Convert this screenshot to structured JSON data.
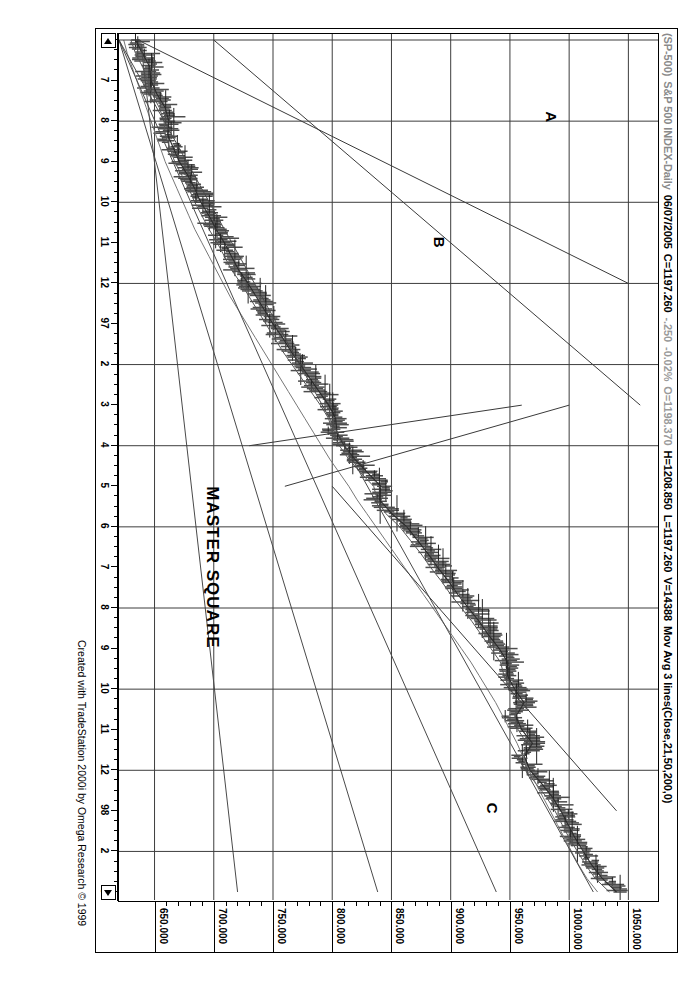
{
  "window": {
    "title_bar": {
      "symbol": "(SP-500)",
      "name": "S&P 500 INDEX-Daily",
      "date": "06/07/2005",
      "close": "C=1197.260",
      "change": "-.250",
      "change_pct": "-0.02%",
      "open": "O=1198.370",
      "high": "H=1208.850",
      "low": "L=1197.260",
      "volume": "V=14388",
      "indicator": "Mov Avg 3 lines(Close,21,50,200,0)"
    }
  },
  "credit": "Created with TradeStation 2000i by Omega Research © 1999",
  "annotations": [
    {
      "id": "a",
      "label": "A"
    },
    {
      "id": "b",
      "label": "B"
    },
    {
      "id": "c",
      "label": "C"
    },
    {
      "id": "master",
      "label": "MASTER SQUARE"
    }
  ],
  "scroll": {
    "left_arrow": "scroll-left",
    "right_arrow": "scroll-right"
  },
  "colors": {
    "bars": "#4d4d4d",
    "ma_short": "#2b2b2b",
    "ma_mid": "#555555",
    "ma_long": "#777777",
    "grid": "#3d3d3d",
    "axis": "#000000",
    "background": "#ffffff"
  },
  "chart_data": {
    "type": "line",
    "subtitle": "Mov Avg 3 lines(Close,21,50,200,0)",
    "xlabel": "",
    "ylabel": "",
    "grid": true,
    "legend": "none",
    "ylim": [
      620,
      1075
    ],
    "yticks": [
      1050.0,
      1000.0,
      950.0,
      900.0,
      850.0,
      800.0,
      750.0,
      700.0,
      650.0
    ],
    "ytick_labels": [
      "1050.000",
      "1000.000",
      "950.000",
      "900.000",
      "850.000",
      "800.000",
      "750.000",
      "700.000",
      "650.000"
    ],
    "xticks": [
      "6",
      "7",
      "8",
      "9",
      "10",
      "11",
      "12",
      "97",
      "2",
      "3",
      "4",
      "5",
      "6",
      "7",
      "8",
      "9",
      "10",
      "11",
      "12",
      "98",
      "2",
      "3"
    ],
    "xtick_labels": [
      "6",
      "7",
      "8",
      "9",
      "10",
      "11",
      "12",
      "97",
      "2",
      "3",
      "4",
      "5",
      "6",
      "7",
      "8",
      "9",
      "10",
      "11",
      "12",
      "98",
      "2",
      "3"
    ],
    "quote": {
      "date": "06/07/2005",
      "open": 1198.37,
      "high": 1208.85,
      "low": 1197.26,
      "close": 1197.26,
      "change": -0.25,
      "change_pct": -0.02,
      "volume": 14388
    },
    "series": [
      {
        "name": "Price (OHLC bars)",
        "type": "ohlc",
        "x": [
          "6",
          "6.3",
          "6.6",
          "7",
          "7.3",
          "7.6",
          "8",
          "8.3",
          "8.6",
          "9",
          "9.3",
          "9.6",
          "10",
          "10.3",
          "10.6",
          "11",
          "11.3",
          "11.6",
          "12",
          "12.3",
          "12.6",
          "97",
          "97.3",
          "97.6",
          "2",
          "2.3",
          "2.6",
          "3",
          "3.3",
          "3.6",
          "4",
          "4.3",
          "4.6",
          "5",
          "5.3",
          "5.6",
          "6",
          "6.3",
          "6.6",
          "7",
          "7.3",
          "7.6",
          "8",
          "8.3",
          "8.6",
          "9",
          "9.3",
          "9.6",
          "10",
          "10.3",
          "10.6",
          "11",
          "11.3",
          "11.6",
          "12",
          "12.3",
          "12.6",
          "98",
          "98.3",
          "98.6",
          "2",
          "2.3",
          "2.6",
          "3"
        ],
        "values": [
          636,
          641,
          648,
          645,
          650,
          660,
          663,
          658,
          667,
          672,
          679,
          685,
          690,
          697,
          703,
          710,
          716,
          722,
          730,
          737,
          744,
          751,
          759,
          766,
          774,
          782,
          790,
          798,
          806,
          800,
          812,
          820,
          832,
          845,
          838,
          852,
          866,
          874,
          883,
          891,
          900,
          908,
          917,
          926,
          934,
          943,
          951,
          946,
          957,
          965,
          950,
          962,
          972,
          958,
          969,
          979,
          988,
          995,
          1000,
          1006,
          1013,
          1020,
          1030,
          1043
        ]
      },
      {
        "name": "Mov Avg 21",
        "type": "line",
        "period": 21,
        "values": [
          634,
          640,
          646,
          647,
          652,
          659,
          662,
          661,
          666,
          671,
          678,
          684,
          689,
          696,
          702,
          709,
          715,
          721,
          729,
          736,
          743,
          750,
          758,
          765,
          773,
          781,
          789,
          797,
          803,
          804,
          810,
          819,
          830,
          841,
          840,
          850,
          863,
          872,
          881,
          889,
          898,
          906,
          915,
          924,
          932,
          941,
          948,
          948,
          954,
          962,
          955,
          960,
          969,
          962,
          967,
          977,
          986,
          993,
          999,
          1005,
          1012,
          1019,
          1028,
          1040
        ]
      },
      {
        "name": "Mov Avg 50",
        "type": "line",
        "period": 50,
        "values": [
          630,
          634,
          640,
          644,
          648,
          654,
          658,
          659,
          663,
          667,
          673,
          679,
          684,
          690,
          696,
          703,
          709,
          715,
          723,
          730,
          737,
          744,
          751,
          758,
          766,
          774,
          782,
          790,
          797,
          800,
          806,
          814,
          824,
          835,
          838,
          845,
          857,
          866,
          875,
          883,
          892,
          900,
          909,
          918,
          926,
          934,
          942,
          945,
          950,
          957,
          954,
          957,
          964,
          962,
          964,
          972,
          981,
          988,
          994,
          1000,
          1007,
          1014,
          1022,
          1034
        ]
      },
      {
        "name": "Mov Avg 200",
        "type": "line",
        "period": 200,
        "values": [
          624,
          627,
          631,
          635,
          639,
          643,
          647,
          651,
          655,
          659,
          664,
          669,
          674,
          679,
          684,
          690,
          696,
          702,
          708,
          714,
          721,
          728,
          735,
          742,
          749,
          756,
          763,
          770,
          777,
          784,
          791,
          798,
          806,
          814,
          821,
          829,
          837,
          845,
          853,
          861,
          869,
          877,
          885,
          893,
          901,
          909,
          917,
          924,
          931,
          938,
          944,
          950,
          956,
          961,
          966,
          972,
          978,
          984,
          990,
          996,
          1002,
          1008,
          1015,
          1024
        ]
      }
    ],
    "trendlines": [
      {
        "name": "master-square-diagonal-1",
        "x1": "6",
        "y1": 700,
        "x2": "3",
        "y2": 1060
      },
      {
        "name": "master-square-diagonal-2",
        "x1": "6",
        "y1": 636,
        "x2": "12",
        "y2": 1050
      },
      {
        "name": "fan-line-a",
        "x1": "5",
        "y1": 800,
        "x2": "98",
        "y2": 1040
      },
      {
        "name": "fan-line-b",
        "x1": "5",
        "y1": 760,
        "x2": "3",
        "y2": 1000
      },
      {
        "name": "fan-line-c",
        "x1": "4",
        "y1": 730,
        "x2": "3",
        "y2": 960
      }
    ]
  }
}
